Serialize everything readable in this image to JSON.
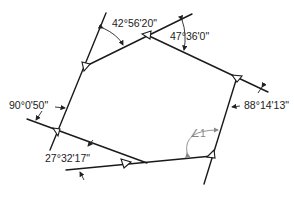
{
  "diagram": {
    "type": "traverse-deflection-angles",
    "angles": [
      {
        "id": "a1",
        "label": "42°56'20\""
      },
      {
        "id": "a2",
        "label": "47°36'0\""
      },
      {
        "id": "a3",
        "label": "88°14'13\""
      },
      {
        "id": "a4",
        "label": "∠1"
      },
      {
        "id": "a5",
        "label": "27°32'17\""
      },
      {
        "id": "a6",
        "label": "90°0'50\""
      }
    ],
    "stations": [
      "A",
      "B",
      "C",
      "D",
      "E",
      "F"
    ],
    "colors": {
      "line": "#1a1a1a",
      "unknown_angle": "#888888",
      "background": "#ffffff"
    }
  }
}
